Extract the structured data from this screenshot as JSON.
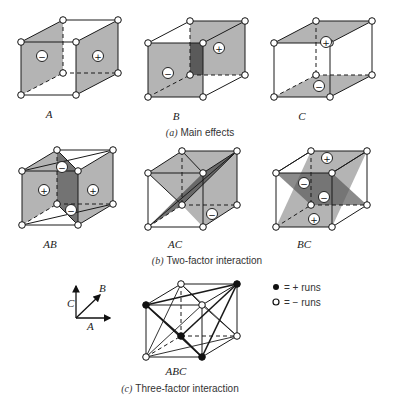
{
  "figure": {
    "sections": [
      {
        "id": "a",
        "caption_letter": "(a)",
        "caption_text": "Main effects",
        "cubes": [
          {
            "label": "A",
            "planes": [
              {
                "face": "left",
                "sign": "−"
              },
              {
                "face": "right",
                "sign": "+"
              }
            ]
          },
          {
            "label": "B",
            "planes": [
              {
                "face": "front",
                "sign": "−"
              },
              {
                "face": "back",
                "sign": "+"
              }
            ]
          },
          {
            "label": "C",
            "planes": [
              {
                "face": "top",
                "sign": "+"
              },
              {
                "face": "bottom",
                "sign": "−"
              }
            ]
          }
        ]
      },
      {
        "id": "b",
        "caption_letter": "(b)",
        "caption_text": "Two-factor interaction",
        "cubes": [
          {
            "label": "AB",
            "signs": [
              "+",
              "+",
              "−",
              "−"
            ]
          },
          {
            "label": "AC",
            "signs": [
              "−"
            ]
          },
          {
            "label": "BC",
            "signs": [
              "+",
              "−",
              "−",
              "+"
            ]
          }
        ]
      },
      {
        "id": "c",
        "caption_letter": "(c)",
        "caption_text": "Three-factor interaction",
        "cubes": [
          {
            "label": "ABC"
          }
        ]
      }
    ],
    "axes": {
      "x": "A",
      "y": "B",
      "z": "C"
    },
    "legend": [
      {
        "symbol": "filled-circle",
        "text": "= + runs"
      },
      {
        "symbol": "open-circle",
        "text": "= − runs"
      }
    ],
    "colors": {
      "plane_fill": "#b4b4b4",
      "plane_dark": "#5a5a5a",
      "line": "#1a1a1a"
    }
  }
}
